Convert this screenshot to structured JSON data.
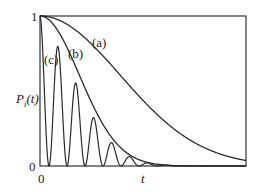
{
  "chart_data": {
    "type": "line",
    "title": "",
    "xlabel": "t",
    "ylabel": "P_i(t)",
    "ylabel_main": "P",
    "ylabel_sub": "i",
    "ylabel_arg": "(t)",
    "xlim": [
      0,
      1
    ],
    "ylim": [
      0,
      1
    ],
    "x_ticks": [
      "0"
    ],
    "y_ticks": [
      "0",
      "1"
    ],
    "grid": false,
    "legend": "inline labels",
    "series": [
      {
        "name": "(a)",
        "label": "(a)",
        "model": "gaussian",
        "width": 0.55,
        "description": "slow monotonic decay from 1, ~0.05 at t=1"
      },
      {
        "name": "(b)",
        "label": "(b)",
        "model": "gaussian",
        "width": 0.27,
        "description": "faster monotonic decay from 1, ~0 by t=0.7"
      },
      {
        "name": "(c)",
        "label": "(c)",
        "model": "damped-cos2",
        "period": 0.0875,
        "envelope_width": 0.27,
        "description": "rapid oscillation between 0 and decaying envelope"
      }
    ],
    "points_c_peaks": [
      {
        "t": 0.0,
        "P": 1.0
      },
      {
        "t": 0.097,
        "P": 0.64
      },
      {
        "t": 0.184,
        "P": 0.41
      },
      {
        "t": 0.272,
        "P": 0.27
      },
      {
        "t": 0.364,
        "P": 0.17
      },
      {
        "t": 0.45,
        "P": 0.09
      },
      {
        "t": 0.54,
        "P": 0.05
      }
    ]
  },
  "labels": {
    "y_one": "1",
    "y_zero": "0",
    "x_zero": "0",
    "x_axis": "t",
    "a": "(a)",
    "b": "(b)",
    "c": "(c)"
  },
  "colors": {
    "line": "#2a2a2a",
    "frame": "#333333",
    "background": "#ffffff"
  }
}
